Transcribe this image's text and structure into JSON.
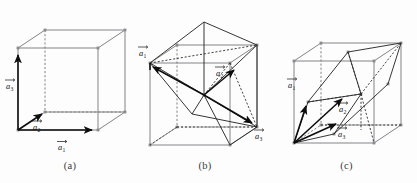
{
  "figure": {
    "kind": "lattice-primitive-vector-diagram",
    "panel_count": 3,
    "colors": {
      "cube_edge": "#7d7d82",
      "hidden_edge": "#7d7d82",
      "primitive_cell": "#2b2b2b",
      "vector": "#0d0d0d",
      "caption": "#3a3a3a",
      "background": "#fdfdfd"
    }
  },
  "panels": [
    {
      "id": "a",
      "caption": "(a)",
      "lattice": "simple cubic",
      "vectors": [
        {
          "id": "a1",
          "label": "a",
          "subscript": "1",
          "arrow": true
        },
        {
          "id": "a2",
          "label": "a",
          "subscript": "2",
          "arrow": true
        },
        {
          "id": "a3",
          "label": "a",
          "subscript": "3",
          "arrow": true
        }
      ]
    },
    {
      "id": "b",
      "caption": "(b)",
      "lattice": "body-centered cubic",
      "vectors": [
        {
          "id": "a1",
          "label": "a",
          "subscript": "1",
          "arrow": true
        },
        {
          "id": "a2",
          "label": "a",
          "subscript": "2",
          "arrow": true
        },
        {
          "id": "a3",
          "label": "a",
          "subscript": "3",
          "arrow": true
        }
      ]
    },
    {
      "id": "c",
      "caption": "(c)",
      "lattice": "face-centered cubic",
      "vectors": [
        {
          "id": "a1",
          "label": "a",
          "subscript": "1",
          "arrow": true
        },
        {
          "id": "a2",
          "label": "a",
          "subscript": "2",
          "arrow": true
        },
        {
          "id": "a3",
          "label": "a",
          "subscript": "3",
          "arrow": true
        }
      ]
    }
  ]
}
